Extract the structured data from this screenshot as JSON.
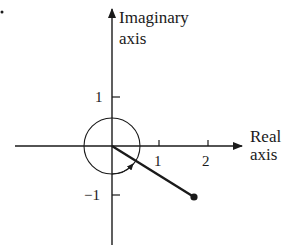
{
  "diagram": {
    "type": "complex-plane",
    "axes": {
      "real_label_line1": "Real",
      "real_label_line2": "axis",
      "imaginary_label_line1": "Imaginary",
      "imaginary_label_line2": "axis"
    },
    "ticks": {
      "x": [
        "1",
        "2"
      ],
      "y_pos": "1",
      "y_neg": "−1"
    },
    "point": {
      "re": 1.7,
      "im": -1.05
    },
    "unit_circle": true,
    "angle_arrow": "clockwise from positive real axis to vector",
    "marker": "•",
    "colors": {
      "ink": "#1a1a1a",
      "background": "#ffffff"
    }
  }
}
